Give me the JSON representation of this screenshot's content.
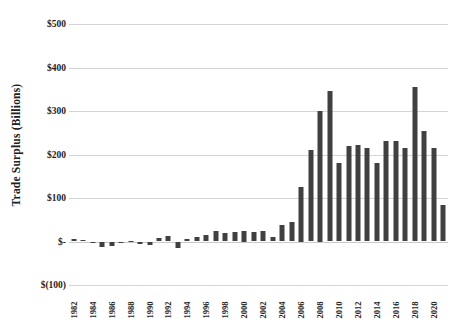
{
  "chart_data": {
    "type": "bar",
    "title": "",
    "subtitle": "",
    "xlabel": "",
    "ylabel": "Trade Surplus (Billions)",
    "ylim": [
      -100,
      500
    ],
    "ytick_values": [
      500,
      400,
      300,
      200,
      100,
      0,
      -100
    ],
    "ytick_labels": [
      "$500",
      "$400",
      "$300",
      "$200",
      "$100",
      "$-",
      "$(100)"
    ],
    "grid": "horizontal",
    "legend": "none",
    "bar_color": "#404040",
    "gridline_color": "#d4d4d4",
    "x_tick_step": 2,
    "x_tick_labels": [
      "1982",
      "1984",
      "1986",
      "1988",
      "1990",
      "1992",
      "1994",
      "1996",
      "1998",
      "2000",
      "2002",
      "2004",
      "2006",
      "2008",
      "2010",
      "2012",
      "2014",
      "2016",
      "2018",
      "2020"
    ],
    "categories": [
      "1982",
      "1983",
      "1984",
      "1985",
      "1986",
      "1987",
      "1988",
      "1989",
      "1990",
      "1991",
      "1992",
      "1993",
      "1994",
      "1995",
      "1996",
      "1997",
      "1998",
      "1999",
      "2000",
      "2001",
      "2002",
      "2003",
      "2004",
      "2005",
      "2006",
      "2007",
      "2008",
      "2009",
      "2010",
      "2011",
      "2012",
      "2013",
      "2014",
      "2015",
      "2016",
      "2017",
      "2018",
      "2019",
      "2020",
      "2021"
    ],
    "values": [
      6,
      4,
      -2,
      -13,
      -10,
      -3,
      2,
      -5,
      -9,
      8,
      12,
      -14,
      5,
      10,
      16,
      24,
      20,
      22,
      25,
      21,
      24,
      10,
      38,
      44,
      125,
      210,
      300,
      345,
      180,
      220,
      222,
      215,
      180,
      230,
      232,
      215,
      355,
      255,
      215,
      85
    ],
    "value_order_note": "bar heights in $ billions, left to right 1982 through 2021",
    "series": [
      {
        "name": "Trade Surplus",
        "values": [
          6,
          4,
          -2,
          -13,
          -10,
          -3,
          2,
          -5,
          -9,
          8,
          12,
          -14,
          5,
          10,
          16,
          24,
          20,
          22,
          25,
          21,
          24,
          10,
          38,
          44,
          125,
          210,
          300,
          345,
          180,
          220,
          222,
          215,
          180,
          230,
          232,
          215,
          355,
          255,
          215,
          85
        ]
      }
    ]
  },
  "axis": {
    "y_title": "Trade Surplus (Billions)"
  }
}
